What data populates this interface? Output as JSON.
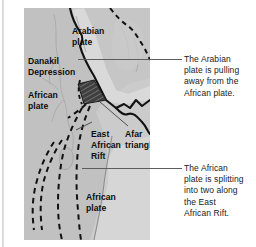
{
  "figure": {
    "kind": "geological-map-diagram",
    "region": "Afar Triangle and East African Rift",
    "panel_background": "#cbcbcb",
    "land_tone": "#c3c3c3",
    "sea_tone": "#d6d6d6",
    "highlight_tone": "#4a4a4a",
    "line_color": "#111111",
    "text_color": "#1a1a1a"
  },
  "map_labels": {
    "arabian_plate": "Arabian\nplate",
    "danakil_depression": "Danakil\nDepression",
    "african_plate_west": "African\nplate",
    "east_african_rift": "East\nAfrican\nRift",
    "afar_triangle": "Afar\ntriangle",
    "african_plate_south": "African\nplate"
  },
  "annotations": {
    "arabian": "The Arabian\nplate is pulling\naway from the\nAfrican plate.",
    "african": "The African\nplate is splitting\ninto two along\nthe East\nAfrican Rift."
  },
  "legend_semantics": {
    "solid_line": "plate boundary / coastline",
    "dashed_line": "rift fault trace",
    "dark_hatched_area": "Danakil block / Afar triangle highlight"
  }
}
